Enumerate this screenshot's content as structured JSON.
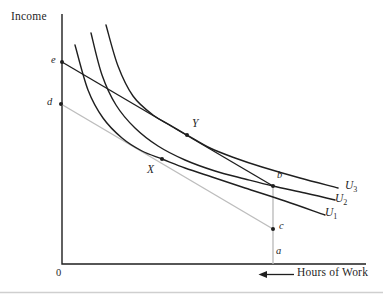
{
  "figure": {
    "ylabel": "Income",
    "xlabel": "Hours of Work",
    "origin": "0",
    "points": {
      "e": "e",
      "d": "d",
      "x": "X",
      "y": "Y",
      "b": "b",
      "c": "c",
      "a": "a"
    },
    "curve_labels": {
      "u1": {
        "base": "U",
        "sub": "1"
      },
      "u2": {
        "base": "U",
        "sub": "2"
      },
      "u3": {
        "base": "U",
        "sub": "3"
      }
    }
  },
  "colors": {
    "ink": "#1f1f1f",
    "gray": "#bdbdbd",
    "page_rule": "#cfcfcf"
  },
  "chart_data": {
    "type": "line",
    "xlabel": "Hours of Work (increasing leftward toward origin)",
    "ylabel": "Income",
    "grid": false,
    "legend": "curve labels U3, U2, U1 at right ends of curves",
    "axes_px": {
      "origin": [
        62,
        264
      ],
      "y_axis_top": 14,
      "x_axis_right": 366
    },
    "curves": [
      {
        "name": "U1",
        "color": "ink",
        "points": [
          [
            75,
            45
          ],
          [
            88,
            90
          ],
          [
            103,
            118
          ],
          [
            122,
            138
          ],
          [
            142,
            151
          ],
          [
            162,
            159
          ],
          [
            185,
            168
          ],
          [
            212,
            177
          ],
          [
            245,
            188
          ],
          [
            285,
            201
          ],
          [
            325,
            215
          ]
        ]
      },
      {
        "name": "U2",
        "color": "ink",
        "points": [
          [
            91,
            33
          ],
          [
            102,
            75
          ],
          [
            116,
            105
          ],
          [
            135,
            128
          ],
          [
            158,
            146
          ],
          [
            185,
            160
          ],
          [
            215,
            171
          ],
          [
            245,
            179
          ],
          [
            273,
            186
          ],
          [
            305,
            193
          ],
          [
            335,
            200
          ]
        ]
      },
      {
        "name": "U3",
        "color": "ink",
        "points": [
          [
            106,
            25
          ],
          [
            118,
            66
          ],
          [
            133,
            96
          ],
          [
            153,
            115
          ],
          [
            170,
            125
          ],
          [
            187,
            135
          ],
          [
            210,
            148
          ],
          [
            235,
            158
          ],
          [
            262,
            167
          ],
          [
            300,
            178
          ],
          [
            338,
            188
          ]
        ]
      }
    ],
    "lines": [
      {
        "name": "budget-line-e-b",
        "color": "ink",
        "from": [
          62,
          62
        ],
        "to": [
          273,
          186
        ]
      },
      {
        "name": "gray-line-d-c",
        "color": "gray",
        "from": [
          61,
          104
        ],
        "to": [
          273,
          229
        ]
      },
      {
        "name": "vertical-line-b-a",
        "color": "gray",
        "from": [
          273,
          186
        ],
        "to": [
          273,
          264
        ]
      }
    ],
    "marked_points": [
      {
        "name": "e",
        "px": [
          62,
          62
        ]
      },
      {
        "name": "d",
        "px": [
          61,
          104
        ]
      },
      {
        "name": "X",
        "px": [
          162,
          159
        ]
      },
      {
        "name": "Y",
        "px": [
          187,
          135
        ]
      },
      {
        "name": "b",
        "px": [
          273,
          186
        ]
      },
      {
        "name": "c",
        "px": [
          273,
          229
        ]
      }
    ],
    "x_axis_arrow": {
      "tail": [
        294,
        274.5
      ],
      "tip": [
        258.5,
        274.5
      ]
    },
    "bottom_rule_y": 292.5
  }
}
